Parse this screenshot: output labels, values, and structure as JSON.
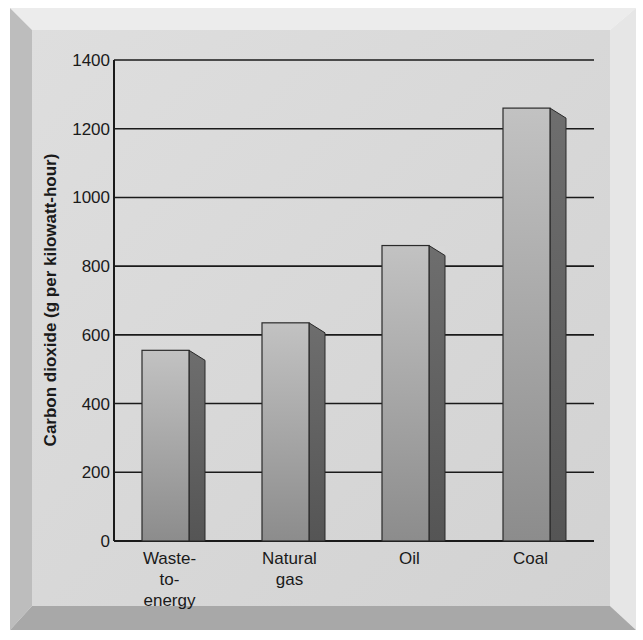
{
  "chart_data": {
    "type": "bar",
    "title": "",
    "xlabel": "",
    "ylabel": "Carbon dioxide (g per kilowatt-hour)",
    "categories": [
      "Waste-to-energy",
      "Natural gas",
      "Oil",
      "Coal"
    ],
    "category_label_lines": [
      [
        "Waste-",
        "to-",
        "energy"
      ],
      [
        "Natural",
        "gas"
      ],
      [
        "Oil"
      ],
      [
        "Coal"
      ]
    ],
    "values": [
      555,
      635,
      860,
      1260
    ],
    "ylim": [
      0,
      1400
    ],
    "yticks": [
      0,
      200,
      400,
      600,
      800,
      1000,
      1200,
      1400
    ],
    "grid": true,
    "legend": "none",
    "style": "3d-bar"
  },
  "colors": {
    "background": "#d9d9d9",
    "bevel_light": "#ececec",
    "bevel_dark": "#a6a6a6",
    "bar_front_top": "#bdbdbd",
    "bar_front_bottom": "#8a8a8a",
    "bar_side": "#5e5e5e",
    "gridline": "#1a1a1a"
  }
}
